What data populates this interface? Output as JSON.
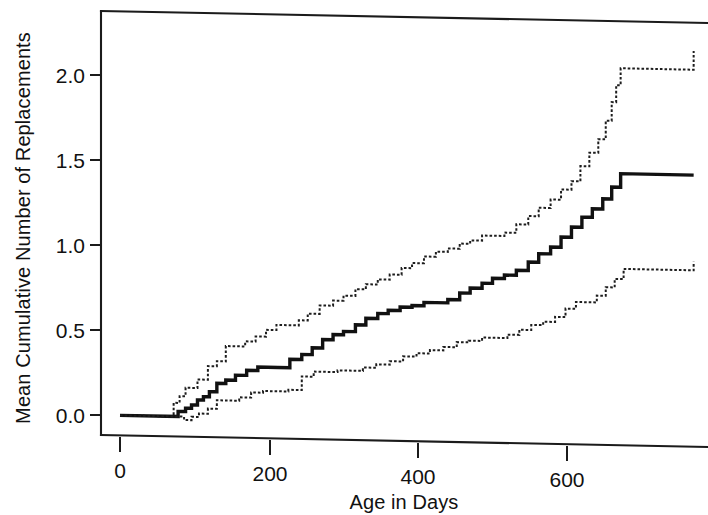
{
  "chart_data": {
    "type": "line",
    "title": "",
    "subtitle": "",
    "xlabel": "Age in Days",
    "ylabel": "Mean Cumulative Number of Replacements",
    "xlim": [
      -30,
      790
    ],
    "ylim": [
      -0.12,
      2.38
    ],
    "xticks": [
      0,
      200,
      400,
      600
    ],
    "xticklabels": [
      "0",
      "200",
      "400",
      "600"
    ],
    "yticks": [
      0.0,
      0.5,
      1.0,
      1.5,
      2.0
    ],
    "yticklabels": [
      "0.0",
      "0.5",
      "1.0",
      "1.5",
      "2.0"
    ],
    "grid": false,
    "legend": null,
    "legend_position": "none",
    "annotations": [],
    "step_style": "post",
    "series": [
      {
        "name": "Upper 95% confidence limit",
        "style": "dotted",
        "color": "#1d1d1d",
        "x": [
          0,
          60,
          72,
          80,
          88,
          96,
          104,
          118,
          130,
          142,
          155,
          168,
          182,
          196,
          210,
          224,
          240,
          252,
          268,
          286,
          300,
          316,
          330,
          346,
          362,
          378,
          392,
          408,
          424,
          440,
          456,
          470,
          486,
          500,
          516,
          532,
          548,
          562,
          578,
          592,
          606,
          618,
          630,
          642,
          652,
          660,
          666,
          672,
          770
        ],
        "y": [
          0.0,
          0.0,
          0.08,
          0.12,
          0.17,
          0.17,
          0.22,
          0.3,
          0.33,
          0.42,
          0.42,
          0.45,
          0.48,
          0.52,
          0.55,
          0.55,
          0.58,
          0.62,
          0.67,
          0.7,
          0.73,
          0.77,
          0.8,
          0.83,
          0.86,
          0.9,
          0.93,
          0.97,
          1.0,
          1.02,
          1.05,
          1.07,
          1.1,
          1.1,
          1.12,
          1.17,
          1.22,
          1.27,
          1.32,
          1.38,
          1.43,
          1.52,
          1.6,
          1.68,
          1.79,
          1.9,
          2.0,
          2.1,
          2.21
        ]
      },
      {
        "name": "MCF estimate",
        "style": "solid",
        "color": "#111111",
        "x": [
          0,
          62,
          78,
          88,
          96,
          104,
          112,
          120,
          130,
          142,
          155,
          170,
          185,
          198,
          212,
          228,
          244,
          258,
          272,
          286,
          300,
          316,
          330,
          346,
          360,
          376,
          392,
          408,
          424,
          440,
          456,
          470,
          486,
          500,
          516,
          532,
          548,
          562,
          578,
          592,
          606,
          620,
          634,
          648,
          660,
          672,
          770
        ],
        "y": [
          0.0,
          0.0,
          0.03,
          0.05,
          0.07,
          0.1,
          0.12,
          0.15,
          0.2,
          0.22,
          0.25,
          0.28,
          0.3,
          0.3,
          0.3,
          0.35,
          0.38,
          0.42,
          0.47,
          0.5,
          0.52,
          0.56,
          0.6,
          0.63,
          0.65,
          0.67,
          0.68,
          0.7,
          0.7,
          0.72,
          0.76,
          0.79,
          0.82,
          0.85,
          0.87,
          0.9,
          0.95,
          1.0,
          1.04,
          1.1,
          1.16,
          1.22,
          1.27,
          1.33,
          1.4,
          1.48,
          1.48
        ]
      },
      {
        "name": "Lower 95% confidence limit",
        "style": "dotted",
        "color": "#1d1d1d",
        "x": [
          0,
          68,
          86,
          96,
          106,
          118,
          130,
          144,
          160,
          176,
          192,
          208,
          226,
          244,
          260,
          276,
          292,
          308,
          326,
          344,
          362,
          380,
          398,
          416,
          434,
          452,
          468,
          486,
          504,
          520,
          536,
          552,
          568,
          584,
          598,
          612,
          626,
          640,
          652,
          664,
          676,
          770
        ],
        "y": [
          0.0,
          0.0,
          -0.02,
          0.0,
          0.02,
          0.05,
          0.1,
          0.1,
          0.12,
          0.15,
          0.16,
          0.16,
          0.17,
          0.25,
          0.28,
          0.28,
          0.29,
          0.29,
          0.31,
          0.33,
          0.35,
          0.38,
          0.4,
          0.42,
          0.44,
          0.47,
          0.48,
          0.5,
          0.5,
          0.52,
          0.55,
          0.58,
          0.6,
          0.63,
          0.68,
          0.72,
          0.72,
          0.76,
          0.81,
          0.86,
          0.92,
          0.97
        ]
      }
    ]
  },
  "axes": {
    "x_axis_label": "Age in Days",
    "y_axis_label": "Mean Cumulative Number of Replacements"
  }
}
